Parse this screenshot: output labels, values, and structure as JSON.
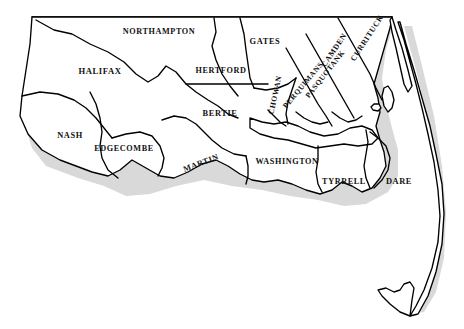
{
  "map": {
    "title": "Northeastern North Carolina Counties",
    "region": "North Carolina",
    "style": {
      "outline_color": "#000000",
      "shadow_color": "#d9d9d9",
      "background_color": "#ffffff",
      "label_color": "#111111"
    },
    "counties": [
      {
        "name": "NORTHAMPTON",
        "x": 159,
        "y": 31,
        "rotation": 0,
        "size": 8.2
      },
      {
        "name": "HALIFAX",
        "x": 100,
        "y": 71,
        "rotation": 0,
        "size": 8.6
      },
      {
        "name": "NASH",
        "x": 70,
        "y": 135,
        "rotation": 0,
        "size": 8.4
      },
      {
        "name": "EDGECOMBE",
        "x": 124,
        "y": 148,
        "rotation": 0,
        "size": 8.2
      },
      {
        "name": "HERTFORD",
        "x": 221,
        "y": 70,
        "rotation": 0,
        "size": 8.2
      },
      {
        "name": "GATES",
        "x": 265,
        "y": 41,
        "rotation": 0,
        "size": 8.4
      },
      {
        "name": "BERTIE",
        "x": 220,
        "y": 113,
        "rotation": 0,
        "size": 8.4
      },
      {
        "name": "MARTIN",
        "x": 201,
        "y": 163,
        "rotation": -21,
        "size": 8.2
      },
      {
        "name": "WASHINGTON",
        "x": 287,
        "y": 161,
        "rotation": 0,
        "size": 8.2
      },
      {
        "name": "TYRRELL",
        "x": 344,
        "y": 181,
        "rotation": 0,
        "size": 8.2
      },
      {
        "name": "DARE",
        "x": 399,
        "y": 181,
        "rotation": 0,
        "size": 8.4
      },
      {
        "name": "CHOWAN",
        "x": 275,
        "y": 95,
        "rotation": -78,
        "size": 7.8
      },
      {
        "name": "PERQUIMANS",
        "x": 303,
        "y": 85,
        "rotation": -50,
        "size": 7.6
      },
      {
        "name": "PASQUOTANK",
        "x": 325,
        "y": 74,
        "rotation": -52,
        "size": 7.6
      },
      {
        "name": "CAMDEN",
        "x": 334,
        "y": 50,
        "rotation": -56,
        "size": 7.8
      },
      {
        "name": "CURRITUCK",
        "x": 367,
        "y": 38,
        "rotation": -57,
        "size": 7.8
      }
    ]
  }
}
